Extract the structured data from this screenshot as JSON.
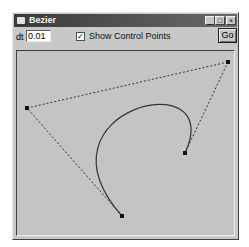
{
  "window": {
    "title": "Bezier",
    "buttons": {
      "minimize": "_",
      "maximize": "□",
      "close": "×"
    }
  },
  "toolbar": {
    "dt_label": "dt",
    "dt_value": "0.01",
    "show_control_points_label": "Show Control Points",
    "show_control_points_checked": true,
    "checkmark": "✓",
    "go_label": "Go"
  },
  "canvas": {
    "background": "#c4c4c4",
    "curve_color": "#333333",
    "control_points": [
      {
        "x": 122,
        "y": 216
      },
      {
        "x": 27,
        "y": 108
      },
      {
        "x": 228,
        "y": 62
      },
      {
        "x": 185,
        "y": 153
      }
    ]
  }
}
